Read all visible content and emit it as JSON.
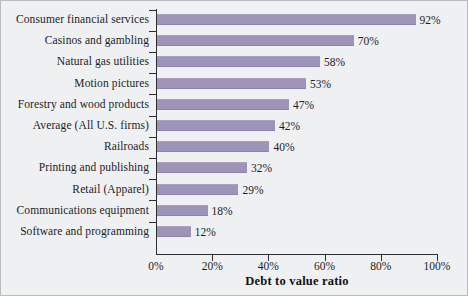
{
  "chart_data": {
    "type": "bar",
    "orientation": "horizontal",
    "title": "",
    "xlabel": "Debt to value ratio",
    "ylabel": "",
    "xlim": [
      0,
      100
    ],
    "xticks": [
      "0%",
      "20%",
      "40%",
      "60%",
      "80%",
      "100%"
    ],
    "xtick_values": [
      0,
      20,
      40,
      60,
      80,
      100
    ],
    "grid": false,
    "legend": false,
    "bar_color": "#9d94b8",
    "background_color": "#eef0f2",
    "categories": [
      "Consumer financial services",
      "Casinos and gambling",
      "Natural gas utilities",
      "Motion pictures",
      "Forestry and wood products",
      "Average (All U.S. firms)",
      "Railroads",
      "Printing and publishing",
      "Retail (Apparel)",
      "Communications equipment",
      "Software and programming"
    ],
    "values": [
      92,
      70,
      58,
      53,
      47,
      42,
      40,
      32,
      29,
      18,
      12
    ],
    "value_labels": [
      "92%",
      "70%",
      "58%",
      "53%",
      "47%",
      "42%",
      "40%",
      "32%",
      "29%",
      "18%",
      "12%"
    ]
  }
}
